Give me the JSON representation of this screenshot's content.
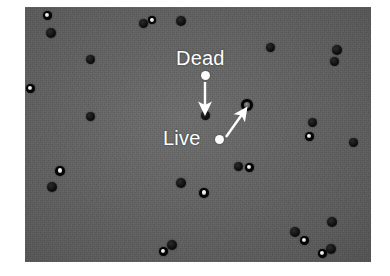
{
  "figure": {
    "panel": {
      "background_color": "#636363",
      "left": 25,
      "top": 7,
      "width": 346,
      "height": 255
    },
    "annotations": [
      {
        "id": "dead",
        "label": "Dead",
        "label_x": 176,
        "label_y": 48,
        "marker_x": 205,
        "marker_y": 75,
        "arrow_from_x": 205,
        "arrow_from_y": 82,
        "arrow_to_x": 205,
        "arrow_to_y": 108,
        "color": "#ffffff",
        "target_x": 205,
        "target_y": 115
      },
      {
        "id": "live",
        "label": "Live",
        "label_x": 163,
        "label_y": 128,
        "marker_x": 219,
        "marker_y": 139,
        "arrow_from_x": 226,
        "arrow_from_y": 137,
        "arrow_to_x": 243,
        "arrow_to_y": 113,
        "color": "#ffffff",
        "target_x": 247,
        "target_y": 105
      }
    ],
    "legend": {
      "dead_description": "Dead",
      "live_description": "Live"
    },
    "cells": [
      {
        "type": "live",
        "x": 47,
        "y": 15,
        "d": 9
      },
      {
        "type": "dead",
        "x": 51,
        "y": 33,
        "d": 10
      },
      {
        "type": "dead",
        "x": 143,
        "y": 23,
        "d": 9
      },
      {
        "type": "live",
        "x": 152,
        "y": 20,
        "d": 8
      },
      {
        "type": "dead",
        "x": 181,
        "y": 21,
        "d": 10
      },
      {
        "type": "dead",
        "x": 270,
        "y": 47,
        "d": 9
      },
      {
        "type": "dead",
        "x": 337,
        "y": 50,
        "d": 10
      },
      {
        "type": "dead",
        "x": 90,
        "y": 59,
        "d": 9
      },
      {
        "type": "dead",
        "x": 334,
        "y": 61,
        "d": 9
      },
      {
        "type": "live",
        "x": 30,
        "y": 88,
        "d": 9
      },
      {
        "type": "dead",
        "x": 90,
        "y": 116,
        "d": 9
      },
      {
        "type": "dead",
        "x": 205,
        "y": 115,
        "d": 9
      },
      {
        "type": "live",
        "x": 247,
        "y": 105,
        "d": 12
      },
      {
        "type": "dead",
        "x": 312,
        "y": 122,
        "d": 9
      },
      {
        "type": "live",
        "x": 309,
        "y": 136,
        "d": 9
      },
      {
        "type": "dead",
        "x": 353,
        "y": 142,
        "d": 9
      },
      {
        "type": "live",
        "x": 60,
        "y": 171,
        "d": 10
      },
      {
        "type": "dead",
        "x": 52,
        "y": 187,
        "d": 10
      },
      {
        "type": "dead",
        "x": 238,
        "y": 166,
        "d": 9
      },
      {
        "type": "live",
        "x": 249,
        "y": 167,
        "d": 9
      },
      {
        "type": "dead",
        "x": 181,
        "y": 183,
        "d": 10
      },
      {
        "type": "live",
        "x": 204,
        "y": 193,
        "d": 10
      },
      {
        "type": "dead",
        "x": 332,
        "y": 222,
        "d": 10
      },
      {
        "type": "dead",
        "x": 295,
        "y": 232,
        "d": 10
      },
      {
        "type": "live",
        "x": 304,
        "y": 240,
        "d": 9
      },
      {
        "type": "live",
        "x": 163,
        "y": 251,
        "d": 9
      },
      {
        "type": "dead",
        "x": 172,
        "y": 245,
        "d": 10
      },
      {
        "type": "live",
        "x": 322,
        "y": 253,
        "d": 9
      },
      {
        "type": "dead",
        "x": 331,
        "y": 249,
        "d": 10
      }
    ]
  }
}
